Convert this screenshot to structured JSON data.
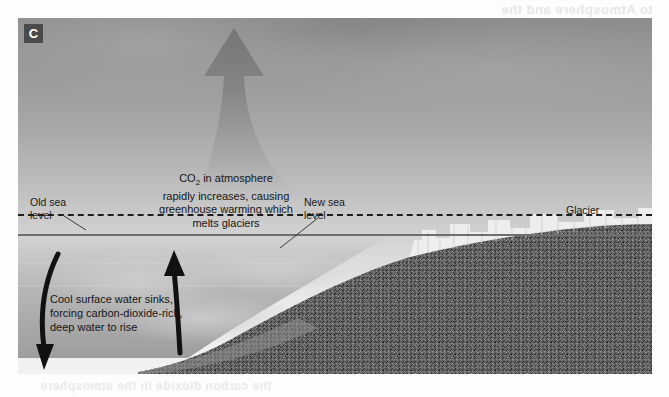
{
  "figure": {
    "panel_label": "C",
    "labels": {
      "old_sea_level": "Old sea\nlevel",
      "new_sea_level": "New sea\nlevel",
      "glacier": "Glacier"
    },
    "captions": {
      "co2_line1": "CO",
      "co2_sub": "2",
      "co2_line1b": " in atmosphere",
      "co2_line2": "rapidly increases, causing",
      "co2_line3": "greenhouse warming which",
      "co2_line4": "melts glaciers",
      "circulation": "Cool surface water sinks, forcing carbon-dioxide-rich, deep water to rise"
    },
    "colors": {
      "sky_top": "#8d8d8d",
      "sky_bottom": "#f2f2f2",
      "plume": "#8a8a8a",
      "land": "#585858",
      "sea_line": "#6f6f6f",
      "old_level_line": "#1d1d1d",
      "badge_bg": "#4a4a4a",
      "badge_text": "#ffffff",
      "label_text": "#1a1a1a"
    },
    "elements": {
      "co2_plume_arrow": "upward-arrow",
      "sinking_arrow": "down-curved-arrow",
      "upwelling_arrow": "up-curved-arrow",
      "ice_cliff": "glacier-ice-cliff",
      "seafloor": "sloping-seabed"
    }
  },
  "bleed_through": {
    "top": "to Atmosphere and the",
    "bottom": "the carbon dioxide in the atmosphere"
  }
}
